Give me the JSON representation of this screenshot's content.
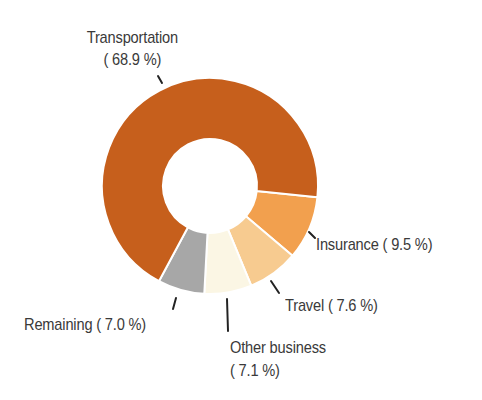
{
  "chart_data": {
    "type": "pie",
    "subtype": "donut",
    "title": "",
    "start_angle_deg_clockwise_from_top": 96,
    "direction": "clockwise",
    "slices": [
      {
        "label": "Insurance",
        "value": 9.5,
        "display": "Insurance ( 9.5 %)",
        "color": "#F2A04E"
      },
      {
        "label": "Travel",
        "value": 7.6,
        "display": "Travel ( 7.6 %)",
        "color": "#F7CB90"
      },
      {
        "label": "Other business",
        "value": 7.1,
        "display_line1": "Other business",
        "display_line2": "( 7.1 %)",
        "color": "#FBF6E4"
      },
      {
        "label": "Remaining",
        "value": 7.0,
        "display": "Remaining ( 7.0 %)",
        "color": "#A7A7A7"
      },
      {
        "label": "Transportation",
        "value": 68.9,
        "display_line1": "Transportation",
        "display_line2": "( 68.9 %)",
        "color": "#C65F1C"
      }
    ],
    "categories": [
      "Transportation",
      "Insurance",
      "Travel",
      "Other business",
      "Remaining"
    ],
    "values": [
      68.9,
      9.5,
      7.6,
      7.1,
      7.0
    ],
    "unit": "%",
    "legend": "none (direct labels with leader lines)"
  },
  "labels": {
    "transportation": {
      "line1": "Transportation",
      "line2": "( 68.9 %)"
    },
    "insurance": {
      "text": "Insurance (  9.5 %)"
    },
    "travel": {
      "text": "Travel (  7.6 %)"
    },
    "other_business": {
      "line1": "Other business",
      "line2": "(  7.1 %)"
    },
    "remaining": {
      "text": "Remaining (  7.0 %)"
    }
  },
  "colors": {
    "text": "#3a3a3a",
    "separator": "#ffffff",
    "leader": "#222222"
  }
}
